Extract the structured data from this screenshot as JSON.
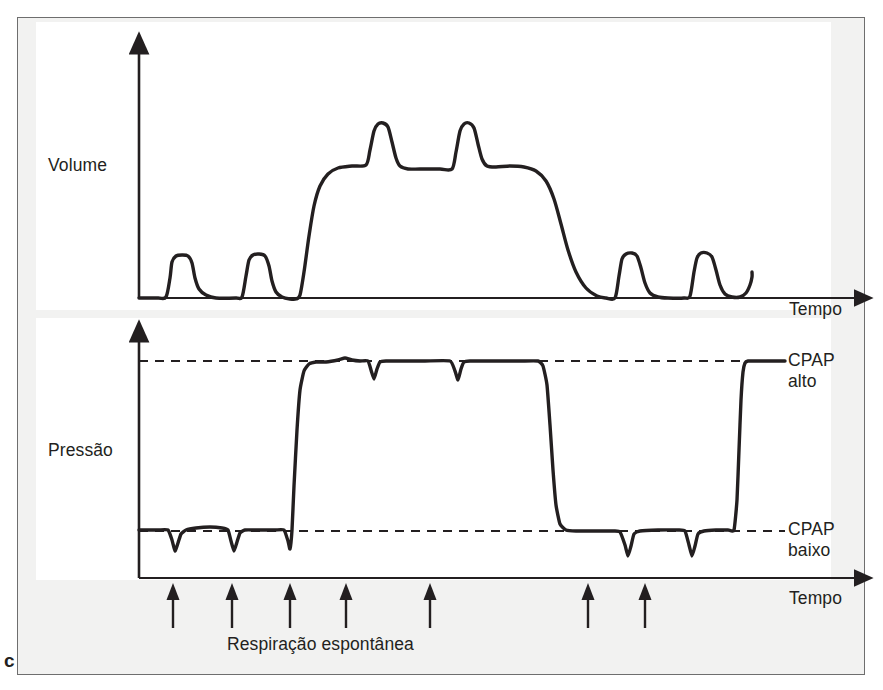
{
  "figure": {
    "panel_id": "c",
    "background_color": "#f2f2f1",
    "plot_background_color": "#ffffff",
    "frame_color": "#6e6e6e",
    "trace_color": "#231f20"
  },
  "labels": {
    "volume": "Volume",
    "pressure": "Pressão",
    "time_volume": "Tempo",
    "time_pressure": "Tempo",
    "cpap_high": "CPAP\nalto",
    "cpap_low": "CPAP\nbaixo",
    "spontaneous_breath": "Respiração espontânea"
  },
  "chart_data": [
    {
      "type": "line",
      "name": "volume-waveform",
      "title": "",
      "xlabel": "Tempo",
      "ylabel": "Volume",
      "grid": false,
      "legend": null,
      "axis": {
        "x_origin": 139,
        "x_end": 862,
        "y_baseline": 298,
        "y_top": 46,
        "arrow_heads": [
          "x-right",
          "y-up"
        ]
      },
      "annotations": [
        {
          "text": "Volume",
          "x": 48,
          "y": 166
        },
        {
          "text": "Tempo",
          "x": 789,
          "y": 310
        }
      ],
      "description": "Volume trace: two small spontaneous breaths at low CPAP, then release to high CPAP producing a large sustained volume plateau with two spontaneous breath spikes riding on top, then decay back to baseline followed by two more small spontaneous breaths.",
      "points": [
        [
          139,
          298
        ],
        [
          158,
          298
        ],
        [
          166,
          297
        ],
        [
          170,
          278
        ],
        [
          172,
          262
        ],
        [
          176,
          256
        ],
        [
          182,
          255
        ],
        [
          188,
          256
        ],
        [
          192,
          263
        ],
        [
          195,
          278
        ],
        [
          199,
          289
        ],
        [
          206,
          295
        ],
        [
          216,
          298
        ],
        [
          236,
          298
        ],
        [
          242,
          297
        ],
        [
          246,
          276
        ],
        [
          249,
          260
        ],
        [
          253,
          255
        ],
        [
          259,
          254
        ],
        [
          265,
          256
        ],
        [
          269,
          266
        ],
        [
          272,
          281
        ],
        [
          276,
          292
        ],
        [
          282,
          297
        ],
        [
          290,
          299
        ],
        [
          296,
          299
        ],
        [
          300,
          295
        ],
        [
          304,
          272
        ],
        [
          309,
          236
        ],
        [
          314,
          206
        ],
        [
          320,
          186
        ],
        [
          328,
          174
        ],
        [
          338,
          168
        ],
        [
          352,
          166
        ],
        [
          366,
          165
        ],
        [
          370,
          150
        ],
        [
          374,
          131
        ],
        [
          378,
          124
        ],
        [
          383,
          123
        ],
        [
          388,
          127
        ],
        [
          392,
          142
        ],
        [
          396,
          158
        ],
        [
          400,
          166
        ],
        [
          408,
          169
        ],
        [
          420,
          169
        ],
        [
          440,
          169
        ],
        [
          452,
          169
        ],
        [
          456,
          152
        ],
        [
          460,
          131
        ],
        [
          464,
          124
        ],
        [
          469,
          123
        ],
        [
          474,
          128
        ],
        [
          478,
          144
        ],
        [
          482,
          159
        ],
        [
          487,
          166
        ],
        [
          496,
          167
        ],
        [
          510,
          166
        ],
        [
          524,
          167
        ],
        [
          536,
          171
        ],
        [
          546,
          181
        ],
        [
          554,
          199
        ],
        [
          561,
          224
        ],
        [
          568,
          250
        ],
        [
          576,
          272
        ],
        [
          586,
          288
        ],
        [
          597,
          296
        ],
        [
          606,
          298
        ],
        [
          615,
          298
        ],
        [
          619,
          276
        ],
        [
          622,
          259
        ],
        [
          626,
          254
        ],
        [
          632,
          253
        ],
        [
          637,
          256
        ],
        [
          641,
          268
        ],
        [
          645,
          283
        ],
        [
          650,
          293
        ],
        [
          658,
          297
        ],
        [
          668,
          298
        ],
        [
          684,
          298
        ],
        [
          690,
          296
        ],
        [
          694,
          272
        ],
        [
          697,
          258
        ],
        [
          701,
          253
        ],
        [
          707,
          253
        ],
        [
          712,
          257
        ],
        [
          716,
          270
        ],
        [
          720,
          285
        ],
        [
          725,
          294
        ],
        [
          732,
          297
        ],
        [
          740,
          297
        ],
        [
          746,
          293
        ],
        [
          750,
          285
        ],
        [
          752,
          277
        ],
        [
          752,
          272
        ]
      ]
    },
    {
      "type": "line",
      "name": "pressure-waveform",
      "title": "",
      "xlabel": "Tempo",
      "ylabel": "Pressão",
      "grid": false,
      "legend": null,
      "axis": {
        "x_origin": 139,
        "x_end": 862,
        "y_baseline": 578,
        "y_top": 334,
        "arrow_heads": [
          "x-right",
          "y-up"
        ]
      },
      "reference_lines": [
        {
          "label": "CPAP alto",
          "y": 361,
          "style": "dashed",
          "x_start": 139,
          "x_end": 785
        },
        {
          "label": "CPAP baixo",
          "y": 531,
          "style": "dashed",
          "x_start": 139,
          "x_end": 785
        }
      ],
      "annotations": [
        {
          "text": "Pressão",
          "x": 48,
          "y": 451
        },
        {
          "text": "Tempo",
          "x": 789,
          "y": 599
        },
        {
          "text": "CPAP alto",
          "x": 788,
          "y": 362
        },
        {
          "text": "CPAP baixo",
          "x": 788,
          "y": 531
        },
        {
          "text": "Respiração espontânea",
          "x": 227,
          "y": 648
        }
      ],
      "description": "Pressure trace: low CPAP baseline with spontaneous-breath negative deflections, a square release to high CPAP (with two deflections on the high plateau), a drop back to low CPAP with two more deflections, then a final rise back to high CPAP.",
      "points": [
        [
          139,
          530
        ],
        [
          158,
          530
        ],
        [
          168,
          530
        ],
        [
          172,
          540
        ],
        [
          175,
          551
        ],
        [
          178,
          543
        ],
        [
          181,
          534
        ],
        [
          186,
          530
        ],
        [
          196,
          528
        ],
        [
          210,
          527
        ],
        [
          222,
          528
        ],
        [
          228,
          530
        ],
        [
          231,
          541
        ],
        [
          234,
          551
        ],
        [
          237,
          542
        ],
        [
          240,
          533
        ],
        [
          245,
          530
        ],
        [
          258,
          530
        ],
        [
          275,
          530
        ],
        [
          284,
          530
        ],
        [
          288,
          541
        ],
        [
          290,
          549
        ],
        [
          292,
          530
        ],
        [
          294,
          486
        ],
        [
          297,
          430
        ],
        [
          300,
          390
        ],
        [
          304,
          371
        ],
        [
          309,
          364
        ],
        [
          316,
          362
        ],
        [
          326,
          362
        ],
        [
          338,
          360
        ],
        [
          345,
          358
        ],
        [
          352,
          360
        ],
        [
          360,
          361
        ],
        [
          368,
          361
        ],
        [
          371,
          370
        ],
        [
          374,
          379
        ],
        [
          377,
          369
        ],
        [
          380,
          362
        ],
        [
          386,
          361
        ],
        [
          400,
          361
        ],
        [
          425,
          361
        ],
        [
          450,
          361
        ],
        [
          455,
          371
        ],
        [
          458,
          380
        ],
        [
          461,
          369
        ],
        [
          464,
          362
        ],
        [
          470,
          361
        ],
        [
          490,
          361
        ],
        [
          520,
          361
        ],
        [
          538,
          361
        ],
        [
          543,
          366
        ],
        [
          547,
          385
        ],
        [
          550,
          425
        ],
        [
          553,
          470
        ],
        [
          556,
          505
        ],
        [
          560,
          524
        ],
        [
          566,
          530
        ],
        [
          576,
          531
        ],
        [
          596,
          531
        ],
        [
          614,
          531
        ],
        [
          620,
          532
        ],
        [
          625,
          545
        ],
        [
          628,
          556
        ],
        [
          631,
          546
        ],
        [
          634,
          534
        ],
        [
          640,
          531
        ],
        [
          658,
          530
        ],
        [
          678,
          530
        ],
        [
          685,
          531
        ],
        [
          689,
          545
        ],
        [
          692,
          556
        ],
        [
          695,
          546
        ],
        [
          698,
          534
        ],
        [
          704,
          531
        ],
        [
          716,
          530
        ],
        [
          728,
          530
        ],
        [
          734,
          530
        ],
        [
          737,
          500
        ],
        [
          739,
          450
        ],
        [
          741,
          400
        ],
        [
          743,
          372
        ],
        [
          745,
          363
        ],
        [
          748,
          361
        ],
        [
          756,
          361
        ],
        [
          770,
          361
        ],
        [
          785,
          361
        ]
      ]
    }
  ],
  "spontaneous_breath_markers": {
    "label": "Respiração espontânea",
    "count": 7,
    "arrow_direction": "up",
    "tip_y": 583,
    "tail_y": 628,
    "x_positions": [
      173,
      232,
      290,
      346,
      430,
      588,
      645
    ]
  }
}
